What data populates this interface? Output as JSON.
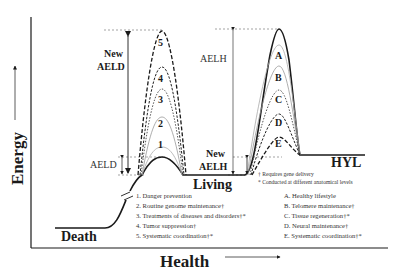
{
  "axes": {
    "y_label": "Energy",
    "x_label": "Health"
  },
  "states": {
    "death": "Death",
    "living": "Living",
    "hyl": "HYL"
  },
  "left_barrier": {
    "new_aeld_line1": "New",
    "new_aeld_line2": "AELD",
    "aeld": "AELD",
    "peak_labels": [
      "1",
      "2",
      "3",
      "4",
      "5"
    ]
  },
  "right_barrier": {
    "aelh": "AELH",
    "new_aelh_line1": "New",
    "new_aelh_line2": "AELH",
    "peak_labels": [
      "A",
      "B",
      "C",
      "D",
      "E"
    ]
  },
  "footnotes": {
    "gene_delivery": "† Requires gene delivery",
    "anatomical": "* Conducted at different anatomical levels"
  },
  "legend_numbers": [
    "1. Danger prevention",
    "2. Routine genome maintenance†",
    "3. Treatments of diseases and disorders†*",
    "4. Tumor suppression†",
    "5. Systematic coordination†*"
  ],
  "legend_letters": [
    "A. Healthy lifestyle",
    "B. Telomere maintenance†",
    "C. Tissue regeneration†*",
    "D. Neural maintenance†",
    "E. Systematic coordination†*"
  ],
  "colors": {
    "ink": "#1a1a1a",
    "gray_curve": "#9a9a9a",
    "dash_guide": "#666666"
  }
}
